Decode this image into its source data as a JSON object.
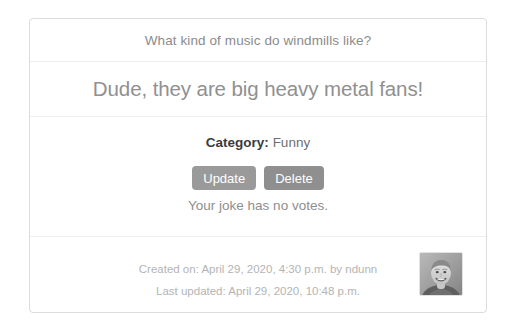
{
  "card": {
    "question": "What kind of music do windmills like?",
    "punchline": "Dude, they are big heavy metal fans!",
    "category": {
      "label": "Category:",
      "value": "Funny"
    },
    "buttons": {
      "update": "Update",
      "delete": "Delete"
    },
    "votes_text": "Your joke has no votes.",
    "footer": {
      "created": "Created on: April 29, 2020, 4:30 p.m. by ndunn",
      "updated": "Last updated: April 29, 2020, 10:48 p.m.",
      "avatar_alt": "user-avatar-photo"
    }
  },
  "colors": {
    "page_background": "#ffffff",
    "card_border": "#dcdcdc",
    "divider": "#eeeeee",
    "question_text": "#8b8b8b",
    "punchline_text": "#909090",
    "category_label": "#3b3b3b",
    "button_background": "#9a9a9a",
    "button_text": "#ffffff",
    "meta_text": "#b4b4b4"
  }
}
